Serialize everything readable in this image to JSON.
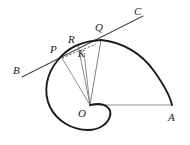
{
  "figure": {
    "background_color": "#ffffff",
    "width": 190,
    "height": 145,
    "stroke_colors": {
      "spiral": "#1b1b1b",
      "arc": "#1b1b1b",
      "tangent_line": "#4a4a4a",
      "radius": "#6a6a6a",
      "baseline": "#8c8c8c",
      "dashed_chord": "#3a3a3a",
      "label": "#1a1a1a"
    },
    "labels": [
      {
        "name": "label-B",
        "text": "B",
        "x": 13,
        "y": 65
      },
      {
        "name": "label-P",
        "text": "P",
        "x": 50,
        "y": 44
      },
      {
        "name": "label-R",
        "text": "R",
        "x": 68,
        "y": 34
      },
      {
        "name": "label-K",
        "text": "K",
        "x": 78,
        "y": 49
      },
      {
        "name": "label-Q",
        "text": "Q",
        "x": 95,
        "y": 22
      },
      {
        "name": "label-C",
        "text": "C",
        "x": 134,
        "y": 6
      },
      {
        "name": "label-O",
        "text": "O",
        "x": 78,
        "y": 108
      },
      {
        "name": "label-A",
        "text": "A",
        "x": 168,
        "y": 112
      }
    ],
    "points": {
      "O": {
        "x": 90,
        "y": 105
      },
      "A": {
        "x": 172,
        "y": 105
      },
      "P": {
        "x": 62,
        "y": 58
      },
      "Q": {
        "x": 101,
        "y": 40
      },
      "R": {
        "x": 78,
        "y": 45
      },
      "K": {
        "x": 84,
        "y": 53
      },
      "B": {
        "x": 22,
        "y": 77
      },
      "C": {
        "x": 143,
        "y": 16
      }
    },
    "elements": {
      "spiral_path": "M 101 40 C 84 41 68 47 58 60 C 46 74 43 92 50 107 C 57 121 72 130 88 130 C 99 130 108 124 110 116 C 112 109 106 104 98 104 C 94 104 91 105 90 105",
      "arc_path": "M 101 40 C 123 42 142 54 154 71 C 164 85 170 96 172 105",
      "baseline_path": "M 90 105 L 172 105",
      "tangent_path": "M 22 77 L 143 16",
      "radius_OP_path": "M 90 105 L 62 58",
      "radius_OR_path": "M 90 105 L 78 45",
      "radius_OK_path": "M 90 105 L 84 53",
      "radius_OQ_path": "M 90 105 L 101 40",
      "dashed_chord_path": "M 62 58 L 96 44"
    }
  }
}
